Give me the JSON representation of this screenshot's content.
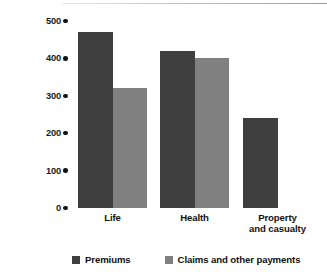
{
  "chart_data": {
    "type": "bar",
    "title": "",
    "xlabel": "",
    "ylabel": "Income and expenditure\n(billions of dollars per year)",
    "ylim": [
      0,
      500
    ],
    "ytick_labels": [
      "500",
      "400",
      "300",
      "200",
      "100",
      "0"
    ],
    "ytick_values": [
      500,
      400,
      300,
      200,
      100,
      0
    ],
    "grid": false,
    "legend_position": "bottom",
    "categories": [
      "Life",
      "Health",
      "Property\nand casualty"
    ],
    "series": [
      {
        "name": "Premiums",
        "color": "#3f3f3f",
        "values": [
          470,
          420,
          240
        ]
      },
      {
        "name": "Claims and other payments",
        "color": "#808080",
        "values": [
          320,
          400,
          null
        ]
      }
    ]
  },
  "colors": {
    "premiums": "#3f3f3f",
    "claims": "#808080",
    "tick_dot": "#111111",
    "background": "#ffffff"
  }
}
